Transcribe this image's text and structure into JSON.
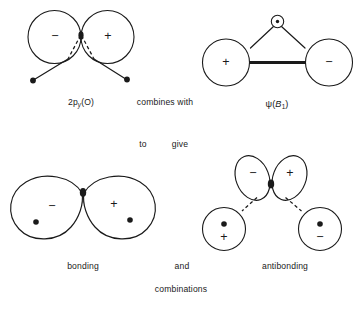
{
  "figure": {
    "kind": "molecular-orbital-combination-diagram",
    "background_color": "#ffffff",
    "ink_color": "#1a1a1a"
  },
  "labels": {
    "top_left_orbital": "2p",
    "top_left_orbital_sub": "y",
    "top_left_orbital_tail": "(O)",
    "connector_1": "combines with",
    "top_right_orbital_psi": "ψ",
    "top_right_orbital_open": "(",
    "top_right_orbital_term": "B",
    "top_right_orbital_sub": "1",
    "top_right_orbital_close": ")",
    "connector_2a": "to",
    "connector_2b": "give",
    "bottom_left": "bonding",
    "connector_3": "and",
    "bottom_right": "antibonding",
    "footer": "combinations"
  },
  "top_left": {
    "name": "2py-oxygen-orbital",
    "lobes": [
      {
        "sign": "−",
        "side": "left"
      },
      {
        "sign": "+",
        "side": "right"
      }
    ],
    "atom_dots": 2,
    "dashed_connectors": 2
  },
  "top_right": {
    "name": "psi-B1-group-orbital",
    "lobes": [
      {
        "sign": "+",
        "side": "left"
      },
      {
        "sign": "−",
        "side": "right"
      }
    ],
    "apex_atom": "lone-pair-atom",
    "bond_style": "thick-sigma-bar"
  },
  "bottom_left": {
    "name": "bonding-combination",
    "lobes": [
      {
        "sign": "−",
        "side": "left",
        "dot": true
      },
      {
        "sign": "+",
        "side": "right",
        "dot": true
      }
    ]
  },
  "bottom_right": {
    "name": "antibonding-combination",
    "upper_lobes": [
      {
        "sign": "−",
        "side": "left"
      },
      {
        "sign": "+",
        "side": "right"
      }
    ],
    "lower_circles": [
      {
        "sign": "+",
        "side": "left",
        "dot": true
      },
      {
        "sign": "−",
        "side": "right",
        "dot": true
      }
    ],
    "dashed_connectors": 2
  },
  "cut_off_caption": ""
}
